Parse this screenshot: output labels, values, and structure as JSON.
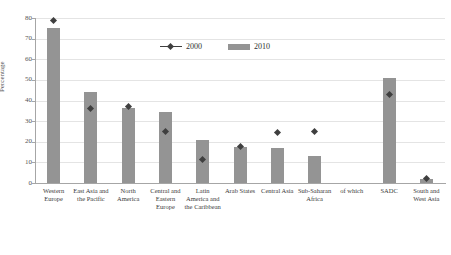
{
  "chart_data": {
    "type": "bar",
    "title": "",
    "xlabel": "",
    "ylabel": "Percentage",
    "ylim": [
      0,
      80
    ],
    "yticks": [
      0,
      10,
      20,
      30,
      40,
      50,
      60,
      70,
      80
    ],
    "grid": true,
    "legend_position": "top-center",
    "categories": [
      "Western Europe",
      "East Asia and the Pacific",
      "North America",
      "Central and Eastern Europe",
      "Latin America and the Caribbean",
      "Arab States",
      "Central Asia",
      "Sub-Saharan Africa",
      "of which",
      "SADC",
      "South and West Asia"
    ],
    "series": [
      {
        "name": "2010",
        "render": "bar",
        "color": "#949494",
        "values": [
          75,
          44,
          36.5,
          34.5,
          21,
          17.5,
          17,
          13.2,
          null,
          51,
          2
        ]
      },
      {
        "name": "2000",
        "render": "marker",
        "color": "#3f3f3f",
        "values": [
          79,
          36.3,
          37.2,
          25,
          11.5,
          17.5,
          24.5,
          24.8,
          null,
          43,
          2
        ]
      }
    ]
  },
  "legend": {
    "items": [
      {
        "label": "2000",
        "marker": "diamond-line-marker",
        "color": "#3f3f3f"
      },
      {
        "label": "2010",
        "marker": "bar-swatch",
        "color": "#949494"
      }
    ]
  },
  "axis": {
    "y_title": "Percentage",
    "y_tick_labels": [
      "0",
      "10",
      "20",
      "30",
      "40",
      "50",
      "60",
      "70",
      "80"
    ]
  }
}
